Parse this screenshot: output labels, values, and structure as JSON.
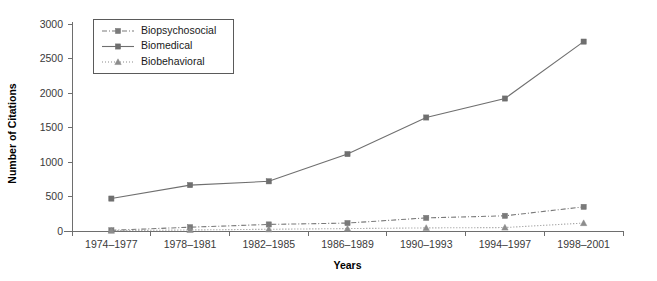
{
  "chart_data": {
    "type": "line",
    "title": "",
    "xlabel": "Years",
    "ylabel": "Number of Citations",
    "categories": [
      "1974–1977",
      "1978–1981",
      "1982–1985",
      "1986–1989",
      "1990–1993",
      "1994–1997",
      "1998–2001"
    ],
    "ylim": [
      0,
      3000
    ],
    "yticks": [
      0,
      500,
      1000,
      1500,
      2000,
      2500,
      3000
    ],
    "ytick_labels": [
      "0",
      "500",
      "1000",
      "1500",
      "2000",
      "2500",
      "3000"
    ],
    "grid": false,
    "legend_position": "upper-left",
    "series": [
      {
        "name": "Biopsychosocial",
        "values": [
          10,
          55,
          95,
          115,
          190,
          220,
          350
        ],
        "marker": "square",
        "dash": "dash-dot",
        "color": "#7a7a7a"
      },
      {
        "name": "Biomedical",
        "values": [
          470,
          665,
          720,
          1115,
          1645,
          1920,
          2745
        ],
        "marker": "square",
        "dash": "solid",
        "color": "#6f6f6f"
      },
      {
        "name": "Biobehavioral",
        "values": [
          5,
          15,
          25,
          35,
          45,
          50,
          115
        ],
        "marker": "triangle",
        "dash": "dotted",
        "color": "#8c8c8c"
      }
    ]
  },
  "axes": {
    "y_axis_title": "Number of Citations",
    "x_axis_title": "Years"
  },
  "legend": {
    "entries": [
      {
        "label": "Biopsychosocial"
      },
      {
        "label": "Biomedical"
      },
      {
        "label": "Biobehavioral"
      }
    ]
  }
}
